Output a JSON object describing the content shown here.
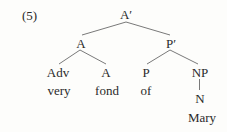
{
  "diagram": {
    "example_number": "(5)",
    "type": "syntax-tree",
    "nodes": {
      "root": "A′",
      "a_phrase": "A",
      "p_bar": "P′",
      "adv": "Adv",
      "a_head": "A",
      "p_head": "P",
      "np": "NP",
      "n": "N"
    },
    "words": {
      "very": "very",
      "fond": "fond",
      "of": "of",
      "mary": "Mary"
    },
    "edges": [
      [
        "A′",
        "A"
      ],
      [
        "A′",
        "P′"
      ],
      [
        "A",
        "Adv"
      ],
      [
        "A",
        "A"
      ],
      [
        "P′",
        "P"
      ],
      [
        "P′",
        "NP"
      ],
      [
        "NP",
        "N"
      ]
    ],
    "colors": {
      "background": "#fdfdfb",
      "text": "#2a2a2a",
      "line": "#6a6a6a"
    }
  }
}
